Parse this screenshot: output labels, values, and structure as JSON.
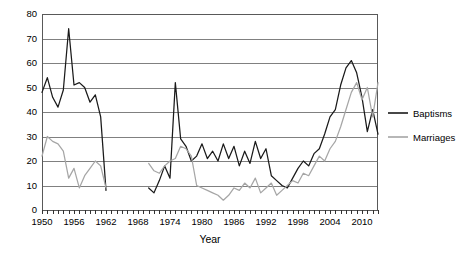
{
  "chart_data": {
    "type": "line",
    "title": "",
    "xlabel": "Year",
    "ylabel": "",
    "xlim": [
      1950,
      2013
    ],
    "ylim": [
      0,
      80
    ],
    "grid": true,
    "legend_position": "right",
    "ytick_labels": [
      "0",
      "10",
      "20",
      "30",
      "40",
      "50",
      "60",
      "70",
      "80"
    ],
    "ytick_values": [
      0,
      10,
      20,
      30,
      40,
      50,
      60,
      70,
      80
    ],
    "xtick_labels": [
      "1950",
      "1956",
      "1962",
      "1968",
      "1974",
      "1980",
      "1986",
      "1992",
      "1998",
      "2004",
      "2010"
    ],
    "xtick_values": [
      1950,
      1956,
      1962,
      1968,
      1974,
      1980,
      1986,
      1992,
      1998,
      2004,
      2010
    ],
    "xtick_minor_step": 1,
    "series": [
      {
        "name": "Baptisms",
        "color": "#1a1a1a",
        "x": [
          1950,
          1951,
          1952,
          1953,
          1954,
          1955,
          1956,
          1957,
          1958,
          1959,
          1960,
          1961,
          1962,
          1970,
          1971,
          1972,
          1973,
          1974,
          1975,
          1976,
          1977,
          1978,
          1979,
          1980,
          1981,
          1982,
          1983,
          1984,
          1985,
          1986,
          1987,
          1988,
          1989,
          1990,
          1991,
          1992,
          1993,
          1994,
          1995,
          1996,
          1997,
          1998,
          1999,
          2000,
          2001,
          2002,
          2003,
          2004,
          2005,
          2006,
          2007,
          2008,
          2009,
          2010,
          2011,
          2012,
          2013
        ],
        "values": [
          48,
          54,
          46,
          42,
          49,
          74,
          51,
          52,
          50,
          44,
          47,
          38,
          8,
          9,
          7,
          12,
          18,
          13,
          52,
          29,
          26,
          20,
          22,
          27,
          21,
          24,
          20,
          27,
          21,
          26,
          18,
          24,
          19,
          28,
          21,
          25,
          14,
          12,
          10,
          9,
          13,
          17,
          20,
          18,
          23,
          25,
          31,
          38,
          41,
          51,
          58,
          61,
          56,
          46,
          32,
          41,
          31
        ]
      },
      {
        "name": "Marriages",
        "color": "#a6a6a6",
        "x": [
          1950,
          1951,
          1952,
          1953,
          1954,
          1955,
          1956,
          1957,
          1958,
          1959,
          1960,
          1961,
          1962,
          1970,
          1971,
          1972,
          1973,
          1974,
          1975,
          1976,
          1977,
          1978,
          1979,
          1980,
          1981,
          1982,
          1983,
          1984,
          1985,
          1986,
          1987,
          1988,
          1989,
          1990,
          1991,
          1992,
          1993,
          1994,
          1995,
          1996,
          1997,
          1998,
          1999,
          2000,
          2001,
          2002,
          2003,
          2004,
          2005,
          2006,
          2007,
          2008,
          2009,
          2010,
          2011,
          2012,
          2013
        ],
        "values": [
          22,
          30,
          28,
          27,
          24,
          13,
          17,
          9,
          14,
          17,
          20,
          18,
          9,
          19,
          16,
          15,
          18,
          20,
          21,
          26,
          25,
          22,
          10,
          9,
          8,
          7,
          6,
          4,
          6,
          9,
          8,
          11,
          9,
          13,
          7,
          9,
          11,
          6,
          8,
          10,
          12,
          11,
          15,
          14,
          18,
          22,
          20,
          25,
          28,
          34,
          41,
          48,
          52,
          45,
          50,
          38,
          52
        ]
      }
    ]
  },
  "legend": {
    "entries": [
      {
        "label": "Baptisms",
        "color": "#1a1a1a"
      },
      {
        "label": "Marriages",
        "color": "#a6a6a6"
      }
    ]
  },
  "axis": {
    "x_title": "Year"
  }
}
